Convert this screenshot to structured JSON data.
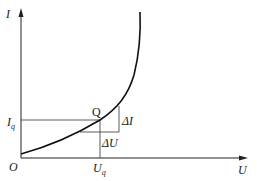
{
  "diagram": {
    "title": "",
    "type": "I-U characteristic curve",
    "axes": {
      "y_label": "I",
      "x_label": "U",
      "origin_label": "O"
    },
    "point": {
      "label": "Q"
    },
    "markers": {
      "current_label": "I",
      "current_sub": "q",
      "voltage_label": "U",
      "voltage_sub": "q",
      "delta_i": "ΔI",
      "delta_u": "ΔU"
    },
    "colors": {
      "line": "#222222",
      "background": "#ffffff"
    }
  }
}
